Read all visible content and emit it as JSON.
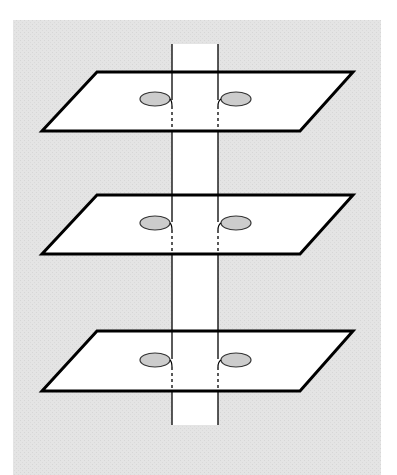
{
  "diagram": {
    "background_color": "#e3e3e3",
    "plane_fill": "#ffffff",
    "plane_stroke": "#000000",
    "disk_fill": "#cfcfcf",
    "strip_fill": "#ffffff",
    "planes": [
      {
        "name": "top-plane",
        "top_y": 72,
        "bottom_y": 131
      },
      {
        "name": "middle-plane",
        "top_y": 195,
        "bottom_y": 254
      },
      {
        "name": "bottom-plane",
        "top_y": 331,
        "bottom_y": 391
      }
    ],
    "strip": {
      "left_x": 172,
      "right_x": 218,
      "top_y": 44,
      "bottom_y": 425
    }
  }
}
